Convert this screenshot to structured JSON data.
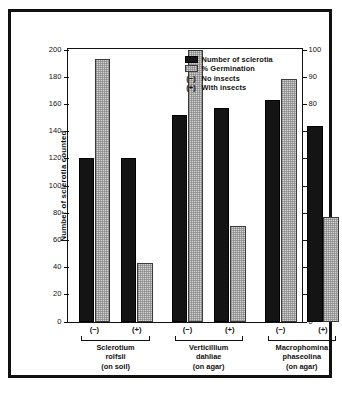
{
  "chart_data": {
    "type": "bar",
    "title": "",
    "xlabel": "",
    "ylabel": "Number of sclerotia counted",
    "ylabel_secondary": "Percent germination",
    "ylim": [
      0,
      200
    ],
    "ylim_secondary": [
      0,
      100
    ],
    "yticks": [
      0,
      20,
      40,
      60,
      80,
      100,
      120,
      140,
      160,
      180,
      200
    ],
    "yticks_secondary": [
      0,
      10,
      20,
      30,
      40,
      50,
      60,
      70,
      80,
      90,
      100
    ],
    "grid": false,
    "legend_position": "top-right",
    "categories": [
      "Sclerotium rolfsii (on soil) (−)",
      "Sclerotium rolfsii (on soil) (+)",
      "Verticillium dahliae (on agar) (−)",
      "Verticillium dahliae (on agar) (+)",
      "Macrophomina phaseolina (on agar) (−)",
      "Macrophomina phaseolina (on agar) (+)"
    ],
    "series": [
      {
        "name": "Number of sclerotia",
        "axis": "left",
        "color": "#141414",
        "values": [
          120,
          120,
          152,
          157,
          163,
          144
        ]
      },
      {
        "name": "% Germination",
        "axis": "right",
        "color": "#d2d2d2",
        "values": [
          96.5,
          21.5,
          100,
          35,
          89,
          38.5
        ]
      }
    ],
    "groups": [
      {
        "name_line1": "Sclerotium",
        "name_line2": "rolfsii",
        "name_line3": "(on soil)",
        "treatments": [
          "(−)",
          "(+)"
        ]
      },
      {
        "name_line1": "Verticillium",
        "name_line2": "dahliae",
        "name_line3": "(on agar)",
        "treatments": [
          "(−)",
          "(+)"
        ]
      },
      {
        "name_line1": "Macrophomina",
        "name_line2": "phaseolina",
        "name_line3": "(on agar)",
        "treatments": [
          "(−)",
          "(+)"
        ]
      }
    ]
  },
  "legend": {
    "items": [
      {
        "type": "swatch-black",
        "label": "Number of sclerotia"
      },
      {
        "type": "swatch-gray",
        "label": "% Germination"
      },
      {
        "type": "symbol",
        "symbol": "(−)",
        "label": "No insects"
      },
      {
        "type": "symbol",
        "symbol": "(+)",
        "label": "With insects"
      }
    ]
  },
  "colors": {
    "bar_black": "#141414",
    "bar_gray": "#d2d2d2",
    "frame": "#111111",
    "background": "#ffffff"
  }
}
